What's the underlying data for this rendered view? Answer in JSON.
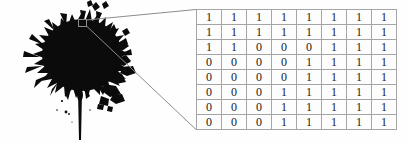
{
  "figure": {
    "title": "",
    "background_color": "#fefefe",
    "ink_color": "#0b0b0b",
    "line_color": "#8c8c8c",
    "grid_line_color": "#a5a5a5",
    "digit_color": "#1a1a1a"
  },
  "blot": {
    "label": "ink-blot",
    "description": "black ink splatter with drip"
  },
  "callout": {
    "source_box_label": "source-region",
    "leader_line_count": 2
  },
  "chart_data": {
    "type": "heatmap",
    "title": "",
    "xlabel": "",
    "ylabel": "",
    "rows": 8,
    "cols": 8,
    "values": [
      [
        1,
        1,
        1,
        1,
        1,
        1,
        1,
        1
      ],
      [
        1,
        1,
        1,
        1,
        1,
        1,
        1,
        1
      ],
      [
        1,
        1,
        0,
        0,
        0,
        1,
        1,
        1
      ],
      [
        0,
        0,
        0,
        0,
        1,
        1,
        1,
        1
      ],
      [
        0,
        0,
        0,
        0,
        1,
        1,
        1,
        1
      ],
      [
        0,
        0,
        0,
        1,
        1,
        1,
        1,
        1
      ],
      [
        0,
        0,
        0,
        1,
        1,
        1,
        1,
        1
      ],
      [
        0,
        0,
        0,
        1,
        1,
        1,
        1,
        1
      ]
    ],
    "legend": [],
    "grid": true
  }
}
